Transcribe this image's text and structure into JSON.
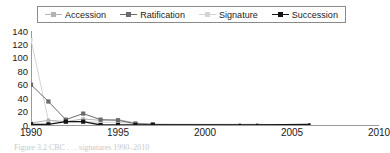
{
  "chart_data": {
    "type": "line",
    "title": "",
    "xlabel": "",
    "ylabel": "",
    "xlim": [
      1990,
      2010
    ],
    "ylim": [
      0,
      140
    ],
    "ytick_values": [
      140,
      120,
      100,
      80,
      60,
      40,
      20,
      0
    ],
    "xtick_values": [
      1990,
      1995,
      2000,
      2005,
      2010
    ],
    "grid": false,
    "legend_position": "top",
    "x": [
      1990,
      1991,
      1992,
      1993,
      1994,
      1995,
      1996,
      1997,
      2002,
      2003,
      2006
    ],
    "series": [
      {
        "name": "Accession",
        "color": "#b3b3b3",
        "marker": "square",
        "values": [
          3,
          7,
          5,
          9,
          7,
          8,
          3,
          1,
          1,
          1,
          0
        ]
      },
      {
        "name": "Ratification",
        "color": "#6b6b6b",
        "marker": "square",
        "values": [
          60,
          35,
          8,
          17,
          8,
          7,
          2,
          1,
          0,
          0,
          0
        ]
      },
      {
        "name": "Signature",
        "color": "#d4d4d4",
        "marker": "square",
        "values": [
          127,
          7,
          4,
          5,
          4,
          4,
          2,
          0,
          0,
          1,
          0
        ]
      },
      {
        "name": "Succession",
        "color": "#141414",
        "marker": "square",
        "values": [
          1,
          1,
          5,
          5,
          0,
          0,
          0,
          0,
          0,
          0,
          1
        ]
      }
    ]
  },
  "legend": {
    "items": [
      {
        "label": "Accession",
        "color": "#b3b3b3"
      },
      {
        "label": "Ratification",
        "color": "#6b6b6b"
      },
      {
        "label": "Signature",
        "color": "#d4d4d4"
      },
      {
        "label": "Succession",
        "color": "#141414"
      }
    ]
  },
  "axes": {
    "y_labels": [
      "140",
      "120",
      "100",
      "80",
      "60",
      "40",
      "20",
      "0"
    ],
    "x_labels": [
      "1990",
      "1995",
      "2000",
      "2005",
      "2010"
    ]
  },
  "caption": {
    "text": "Figure 3.2   CBC . . . signatures 1990–2010"
  }
}
